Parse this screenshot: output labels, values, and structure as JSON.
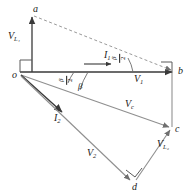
{
  "figure": {
    "type": "phasor-vector-diagram",
    "stroke_color": "#3a3a3a",
    "dashed_color": "#8a8a8a",
    "text_color": "#1a1a1a",
    "background": "#ffffff"
  },
  "vertices": [
    {
      "id": "a",
      "label": "a",
      "x": 36,
      "y": 12
    },
    {
      "id": "o",
      "label": "o",
      "x": 18,
      "y": 73
    },
    {
      "id": "b",
      "label": "b",
      "x": 178,
      "y": 71
    },
    {
      "id": "c",
      "label": "c",
      "x": 172,
      "y": 130
    },
    {
      "id": "d",
      "label": "d",
      "x": 135,
      "y": 185
    }
  ],
  "vectors": [
    {
      "id": "VL1",
      "label": "V",
      "subscript": "L₁",
      "from": "o",
      "to": "a",
      "label_x": 10,
      "label_y": 36
    },
    {
      "id": "I1",
      "label": "I",
      "subscript": "1",
      "from": "o",
      "to": "b",
      "label_x": 107,
      "label_y": 56
    },
    {
      "id": "I2",
      "label": "I",
      "subscript": "2",
      "from": "o",
      "to": "c",
      "label_x": 57,
      "label_y": 118
    },
    {
      "id": "V1",
      "label": "V",
      "subscript": "1",
      "from": "o",
      "to": "b",
      "label_x": 137,
      "label_y": 80
    },
    {
      "id": "Vc",
      "label": "V",
      "subscript": "c",
      "from": "o",
      "to": "c",
      "label_x": 128,
      "label_y": 105
    },
    {
      "id": "V2",
      "label": "V",
      "subscript": "2",
      "from": "o",
      "to": "d",
      "label_x": 90,
      "label_y": 152
    },
    {
      "id": "VL2",
      "label": "V",
      "subscript": "L₂",
      "from": "d",
      "to": "c",
      "label_x": 159,
      "label_y": 143
    }
  ],
  "angles": [
    {
      "id": "delta-over-2-origin",
      "numerator": "β",
      "denominator": "2",
      "x": 66,
      "y": 74,
      "orientation": "rotated"
    },
    {
      "id": "beta-origin",
      "label": "β",
      "x": 80,
      "y": 84
    },
    {
      "id": "beta-over-2-at-b",
      "numerator": "β",
      "denominator": "2",
      "x": 119,
      "y": 52,
      "orientation": "rotated"
    }
  ],
  "right_angle_markers": [
    {
      "id": "right-angle-at-o",
      "x": 18,
      "y": 73
    },
    {
      "id": "right-angle-at-b",
      "x": 178,
      "y": 71
    },
    {
      "id": "right-angle-at-d",
      "x": 135,
      "y": 185
    }
  ],
  "dashed_lines": [
    {
      "id": "a-to-b-dashed",
      "from": "a",
      "to": "b"
    }
  ]
}
